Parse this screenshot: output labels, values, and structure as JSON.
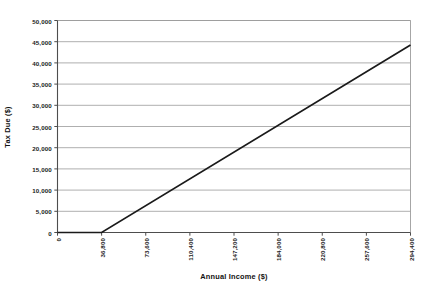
{
  "chart_data": {
    "type": "line",
    "title": "",
    "subtitle": "",
    "xlabel": "Annual Income ($)",
    "ylabel": "Tax Due ($)",
    "xlim": [
      0,
      294400
    ],
    "ylim": [
      0,
      50000
    ],
    "grid": "horizontal",
    "legend": "none",
    "x_tick_labels": [
      "0",
      "36,800",
      "73,600",
      "110,400",
      "147,200",
      "184,000",
      "220,800",
      "257,600",
      "294,400"
    ],
    "x_tick_values": [
      0,
      36800,
      73600,
      110400,
      147200,
      184000,
      220800,
      257600,
      294400
    ],
    "y_tick_labels": [
      "0",
      "5,000",
      "10,000",
      "15,000",
      "20,000",
      "25,000",
      "30,000",
      "35,000",
      "40,000",
      "45,000",
      "50,000"
    ],
    "y_tick_values": [
      0,
      5000,
      10000,
      15000,
      20000,
      25000,
      30000,
      35000,
      40000,
      45000,
      50000
    ],
    "series": [
      {
        "name": "Tax Due",
        "color": "#1a1a1a",
        "x": [
          0,
          36800,
          294400
        ],
        "values": [
          0,
          0,
          44200
        ]
      }
    ],
    "annotations": []
  },
  "style": {
    "line_color": "#1a1a1a",
    "grid_color": "#a6a6a6",
    "frame_color": "#9c9c9c",
    "axis_color": "#4d4d4d",
    "background": "#ffffff"
  }
}
